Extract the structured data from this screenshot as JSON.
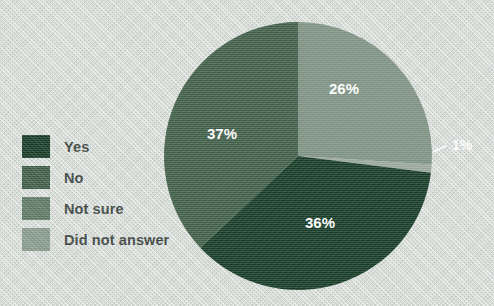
{
  "background_color": "#d7dcd8",
  "legend": {
    "items": [
      {
        "label": "Yes",
        "color": "#133823"
      },
      {
        "label": "No",
        "color": "#3e5c46"
      },
      {
        "label": "Not sure",
        "color": "#5f7a66"
      },
      {
        "label": "Did not answer",
        "color": "#8b9e8f"
      }
    ]
  },
  "chart_data": {
    "type": "pie",
    "title": "",
    "categories": [
      "Yes",
      "No",
      "Not sure",
      "Did not answer"
    ],
    "values": [
      36,
      37,
      26,
      1
    ],
    "value_labels": [
      "36%",
      "37%",
      "26%",
      "1%"
    ],
    "colors": [
      "#133823",
      "#3e5c46",
      "#7d9182",
      "#9aa79c"
    ],
    "legend_position": "left",
    "grid": false,
    "units": "percent",
    "slices": [
      {
        "name": "Not sure",
        "value": 26,
        "label": "26%",
        "color": "#7d9182",
        "start_angle": 0,
        "end_angle": 93.6,
        "label_x": 344,
        "label_y": 90,
        "callout": false
      },
      {
        "name": "Did not answer",
        "value": 1,
        "label": "1%",
        "color": "#9aa79c",
        "start_angle": 93.6,
        "end_angle": 97.2,
        "label_x": 452,
        "label_y": 146,
        "callout": true,
        "callout_line": "M 433,152 L 446,146"
      },
      {
        "name": "Yes",
        "value": 36,
        "label": "36%",
        "color": "#133823",
        "start_angle": 97.2,
        "end_angle": 226.8,
        "label_x": 320,
        "label_y": 224,
        "callout": false
      },
      {
        "name": "No",
        "value": 37,
        "label": "37%",
        "color": "#3e5c46",
        "start_angle": 226.8,
        "end_angle": 360,
        "label_x": 222,
        "label_y": 135,
        "callout": false
      }
    ],
    "geometry": {
      "cx": 298,
      "cy": 156,
      "r": 134
    }
  }
}
